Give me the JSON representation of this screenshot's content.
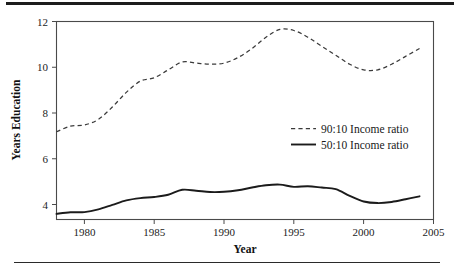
{
  "chart_data": {
    "type": "line",
    "title": "",
    "xlabel": "Year",
    "ylabel": "Years Education",
    "xlim": [
      1978,
      2005
    ],
    "ylim": [
      3.3,
      12.1
    ],
    "xticks": [
      1980,
      1985,
      1990,
      1995,
      2000,
      2005
    ],
    "yticks": [
      4,
      6,
      8,
      10,
      12
    ],
    "xtick_labels": [
      "1980",
      "1985",
      "1990",
      "1995",
      "2000",
      "2005"
    ],
    "ytick_labels": [
      "4",
      "6",
      "8",
      "10",
      "12"
    ],
    "grid": false,
    "legend_position": "center-right",
    "x": [
      1978,
      1979,
      1980,
      1981,
      1982,
      1983,
      1984,
      1985,
      1986,
      1987,
      1988,
      1989,
      1990,
      1991,
      1992,
      1993,
      1994,
      1995,
      1996,
      1997,
      1998,
      1999,
      2000,
      2001,
      2002,
      2003,
      2004
    ],
    "series": [
      {
        "name": "90:10 Income ratio",
        "style": "dashed",
        "color": "#3a3a3a",
        "values": [
          7.2,
          7.45,
          7.5,
          7.75,
          8.3,
          8.95,
          9.45,
          9.6,
          9.95,
          10.3,
          10.25,
          10.2,
          10.25,
          10.5,
          10.9,
          11.4,
          11.75,
          11.7,
          11.4,
          11.0,
          10.6,
          10.2,
          9.95,
          9.95,
          10.2,
          10.55,
          10.9
        ]
      },
      {
        "name": "50:10 Income ratio",
        "style": "solid",
        "color": "#1b1b1b",
        "values": [
          3.55,
          3.62,
          3.63,
          3.75,
          3.95,
          4.15,
          4.25,
          4.3,
          4.4,
          4.62,
          4.58,
          4.52,
          4.53,
          4.6,
          4.72,
          4.82,
          4.85,
          4.75,
          4.78,
          4.72,
          4.65,
          4.35,
          4.1,
          4.03,
          4.08,
          4.2,
          4.33
        ]
      }
    ],
    "legend_entries": [
      {
        "label": "90:10 Income ratio",
        "style": "dashed"
      },
      {
        "label": "50:10 Income ratio",
        "style": "solid"
      }
    ]
  },
  "figure": {
    "top_rule": "horizontal-rule",
    "bottom_rule": "horizontal-rule"
  }
}
